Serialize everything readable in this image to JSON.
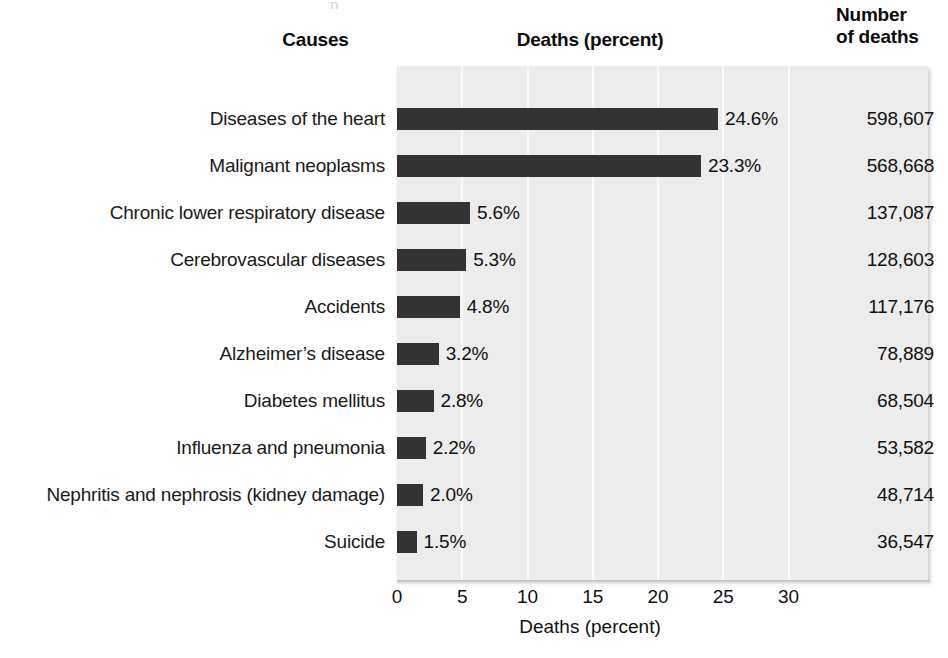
{
  "headers": {
    "causes": "Causes",
    "deaths_percent": "Deaths (percent)",
    "number_line1": "Number",
    "number_line2": "of deaths"
  },
  "axis": {
    "title": "Deaths (percent)",
    "ticks": [
      "0",
      "5",
      "10",
      "15",
      "20",
      "25",
      "30"
    ]
  },
  "colors": {
    "bar": "#333333",
    "plot_background": "#ececec",
    "gridline": "#fbfbfb",
    "text": "#111111"
  },
  "scan_remnant": "p       ",
  "rows": [
    {
      "cause": "Diseases of the heart",
      "percent_label": "24.6%",
      "percent": 24.6,
      "deaths": "598,607"
    },
    {
      "cause": "Malignant neoplasms",
      "percent_label": "23.3%",
      "percent": 23.3,
      "deaths": "568,668"
    },
    {
      "cause": "Chronic lower respiratory disease",
      "percent_label": "5.6%",
      "percent": 5.6,
      "deaths": "137,087"
    },
    {
      "cause": "Cerebrovascular diseases",
      "percent_label": "5.3%",
      "percent": 5.3,
      "deaths": "128,603"
    },
    {
      "cause": "Accidents",
      "percent_label": "4.8%",
      "percent": 4.8,
      "deaths": "117,176"
    },
    {
      "cause": "Alzheimer’s disease",
      "percent_label": "3.2%",
      "percent": 3.2,
      "deaths": "78,889"
    },
    {
      "cause": "Diabetes mellitus",
      "percent_label": "2.8%",
      "percent": 2.8,
      "deaths": "68,504"
    },
    {
      "cause": "Influenza and pneumonia",
      "percent_label": "2.2%",
      "percent": 2.2,
      "deaths": "53,582"
    },
    {
      "cause": "Nephritis and nephrosis (kidney damage)",
      "percent_label": "2.0%",
      "percent": 2.0,
      "deaths": "48,714"
    },
    {
      "cause": "Suicide",
      "percent_label": "1.5%",
      "percent": 1.5,
      "deaths": "36,547"
    }
  ],
  "chart_data": {
    "type": "bar",
    "orientation": "horizontal",
    "title": "",
    "xlabel": "Deaths (percent)",
    "ylabel": "Causes",
    "xlim": [
      0,
      34
    ],
    "xticks": [
      0,
      5,
      10,
      15,
      20,
      25,
      30
    ],
    "grid": "vertical",
    "legend": "none",
    "categories": [
      "Diseases of the heart",
      "Malignant neoplasms",
      "Chronic lower respiratory disease",
      "Cerebrovascular diseases",
      "Accidents",
      "Alzheimer’s disease",
      "Diabetes mellitus",
      "Influenza and pneumonia",
      "Nephritis and nephrosis (kidney damage)",
      "Suicide"
    ],
    "values": [
      24.6,
      23.3,
      5.6,
      5.3,
      4.8,
      3.2,
      2.8,
      2.2,
      2.0,
      1.5
    ],
    "value_labels": [
      "24.6%",
      "23.3%",
      "5.6%",
      "5.3%",
      "4.8%",
      "3.2%",
      "2.8%",
      "2.2%",
      "2.0%",
      "1.5%"
    ],
    "annotations": {
      "column_header": "Number of deaths",
      "counts": [
        "598,607",
        "568,668",
        "137,087",
        "128,603",
        "117,176",
        "78,889",
        "68,504",
        "53,582",
        "48,714",
        "36,547"
      ]
    }
  }
}
